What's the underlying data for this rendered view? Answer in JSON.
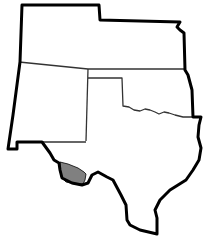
{
  "map": {
    "type": "regional-outline-map",
    "regions": [
      {
        "name": "Colorado",
        "highlighted": false
      },
      {
        "name": "Kansas",
        "highlighted": false
      },
      {
        "name": "New Mexico",
        "highlighted": false
      },
      {
        "name": "Oklahoma",
        "highlighted": false
      },
      {
        "name": "Texas",
        "highlighted": false
      },
      {
        "name": "West Texas highlighted area",
        "highlighted": true
      }
    ],
    "colors": {
      "background": "#ffffff",
      "outline": "#000000",
      "inner_border": "#333333",
      "highlight": "#808080"
    }
  }
}
